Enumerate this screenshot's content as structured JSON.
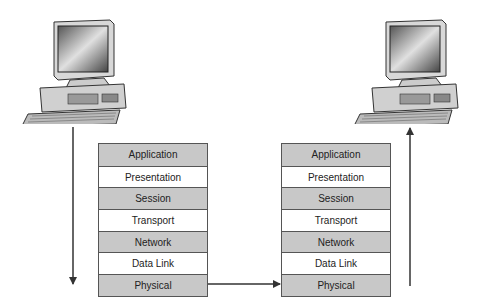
{
  "diagram": {
    "type": "OSI model data flow between two computers",
    "left_stack": {
      "layers": [
        "Application",
        "Presentation",
        "Session",
        "Transport",
        "Network",
        "Data Link",
        "Physical"
      ]
    },
    "right_stack": {
      "layers": [
        "Application",
        "Presentation",
        "Session",
        "Transport",
        "Network",
        "Data Link",
        "Physical"
      ]
    },
    "left_computer": {
      "icon": "desktop-computer-icon"
    },
    "right_computer": {
      "icon": "desktop-computer-icon"
    },
    "arrows": [
      {
        "name": "down-arrow",
        "direction": "down",
        "from": "left computer",
        "to": "left stack physical"
      },
      {
        "name": "physical-link-arrow",
        "direction": "right",
        "from": "left physical",
        "to": "right physical"
      },
      {
        "name": "up-arrow",
        "direction": "up",
        "from": "right stack physical",
        "to": "right computer"
      }
    ],
    "colors": {
      "shaded_layer": "#c8c8c8",
      "light_layer": "#ffffff",
      "border": "#555555",
      "arrow": "#333333"
    }
  }
}
